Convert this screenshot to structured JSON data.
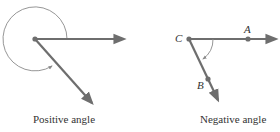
{
  "figures": [
    {
      "id": "positive",
      "caption": "Positive angle",
      "vertex": [
        35,
        39
      ],
      "ray1_end": [
        126,
        39
      ],
      "ray2_end": [
        93,
        104
      ],
      "arc_direction": "counterclockwise"
    },
    {
      "id": "negative",
      "caption": "Negative angle",
      "vertex": [
        189,
        39
      ],
      "ray1_end": [
        278,
        39
      ],
      "ray2_end": [
        219,
        101
      ],
      "arc_direction": "clockwise",
      "points": [
        {
          "label": "C",
          "pos": [
            189,
            39
          ],
          "label_pos": [
            174,
            33
          ]
        },
        {
          "label": "A",
          "pos": [
            248,
            39
          ],
          "label_pos": [
            244,
            25
          ]
        },
        {
          "label": "B",
          "pos": [
            208,
            79
          ],
          "label_pos": [
            196,
            80
          ]
        }
      ]
    }
  ],
  "colors": {
    "ray": "#6e6e6e",
    "arc": "#8a8a8a",
    "point": "#6e6e6e",
    "text": "#333333"
  }
}
